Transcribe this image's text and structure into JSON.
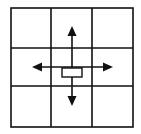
{
  "diagram": {
    "type": "3x3 grid with four directional arrows from center",
    "colors": {
      "line": "#111111",
      "background": "#ffffff"
    },
    "grid": {
      "rows": 3,
      "cols": 3
    },
    "arrows": [
      {
        "direction": "up",
        "icon": "arrow-up-icon"
      },
      {
        "direction": "down",
        "icon": "arrow-down-icon"
      },
      {
        "direction": "left",
        "icon": "arrow-left-icon"
      },
      {
        "direction": "right",
        "icon": "arrow-right-icon"
      }
    ],
    "center_marker": "rectangle"
  }
}
